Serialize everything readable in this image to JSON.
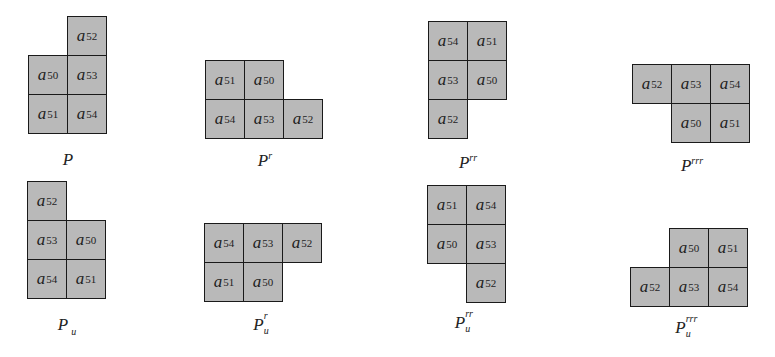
{
  "figure": {
    "cell_fill": "#b9b9b9",
    "cell_border": "#1a1a1a",
    "cell_size_px": 40,
    "panels": [
      {
        "id": "P",
        "caption": {
          "base": "P",
          "sup": "",
          "sub": ""
        },
        "cells": [
          {
            "var": "a",
            "idx": "52",
            "col": 1,
            "row": 0
          },
          {
            "var": "a",
            "idx": "50",
            "col": 0,
            "row": 1
          },
          {
            "var": "a",
            "idx": "53",
            "col": 1,
            "row": 1
          },
          {
            "var": "a",
            "idx": "51",
            "col": 0,
            "row": 2
          },
          {
            "var": "a",
            "idx": "54",
            "col": 1,
            "row": 2
          }
        ]
      },
      {
        "id": "Pr",
        "caption": {
          "base": "P",
          "sup": "r",
          "sub": ""
        },
        "cells": [
          {
            "var": "a",
            "idx": "51",
            "col": 0,
            "row": 0
          },
          {
            "var": "a",
            "idx": "50",
            "col": 1,
            "row": 0
          },
          {
            "var": "a",
            "idx": "54",
            "col": 0,
            "row": 1
          },
          {
            "var": "a",
            "idx": "53",
            "col": 1,
            "row": 1
          },
          {
            "var": "a",
            "idx": "52",
            "col": 2,
            "row": 1
          }
        ]
      },
      {
        "id": "Prr",
        "caption": {
          "base": "P",
          "sup": "rr",
          "sub": ""
        },
        "cells": [
          {
            "var": "a",
            "idx": "54",
            "col": 0,
            "row": 0
          },
          {
            "var": "a",
            "idx": "51",
            "col": 1,
            "row": 0
          },
          {
            "var": "a",
            "idx": "53",
            "col": 0,
            "row": 1
          },
          {
            "var": "a",
            "idx": "50",
            "col": 1,
            "row": 1
          },
          {
            "var": "a",
            "idx": "52",
            "col": 0,
            "row": 2
          }
        ]
      },
      {
        "id": "Prrr",
        "caption": {
          "base": "P",
          "sup": "rrr",
          "sub": ""
        },
        "cells": [
          {
            "var": "a",
            "idx": "52",
            "col": 0,
            "row": 0
          },
          {
            "var": "a",
            "idx": "53",
            "col": 1,
            "row": 0
          },
          {
            "var": "a",
            "idx": "54",
            "col": 2,
            "row": 0
          },
          {
            "var": "a",
            "idx": "50",
            "col": 1,
            "row": 1
          },
          {
            "var": "a",
            "idx": "51",
            "col": 2,
            "row": 1
          }
        ]
      },
      {
        "id": "Pu",
        "caption": {
          "base": "P",
          "sup": "",
          "sub": "u"
        },
        "cells": [
          {
            "var": "a",
            "idx": "52",
            "col": 0,
            "row": 0
          },
          {
            "var": "a",
            "idx": "53",
            "col": 0,
            "row": 1
          },
          {
            "var": "a",
            "idx": "50",
            "col": 1,
            "row": 1
          },
          {
            "var": "a",
            "idx": "54",
            "col": 0,
            "row": 2
          },
          {
            "var": "a",
            "idx": "51",
            "col": 1,
            "row": 2
          }
        ]
      },
      {
        "id": "Pur",
        "caption": {
          "base": "P",
          "sup": "r",
          "sub": "u"
        },
        "cells": [
          {
            "var": "a",
            "idx": "54",
            "col": 0,
            "row": 0
          },
          {
            "var": "a",
            "idx": "53",
            "col": 1,
            "row": 0
          },
          {
            "var": "a",
            "idx": "52",
            "col": 2,
            "row": 0
          },
          {
            "var": "a",
            "idx": "51",
            "col": 0,
            "row": 1
          },
          {
            "var": "a",
            "idx": "50",
            "col": 1,
            "row": 1
          }
        ]
      },
      {
        "id": "Purr",
        "caption": {
          "base": "P",
          "sup": "rr",
          "sub": "u"
        },
        "cells": [
          {
            "var": "a",
            "idx": "51",
            "col": 0,
            "row": 0
          },
          {
            "var": "a",
            "idx": "54",
            "col": 1,
            "row": 0
          },
          {
            "var": "a",
            "idx": "50",
            "col": 0,
            "row": 1
          },
          {
            "var": "a",
            "idx": "53",
            "col": 1,
            "row": 1
          },
          {
            "var": "a",
            "idx": "52",
            "col": 1,
            "row": 2
          }
        ]
      },
      {
        "id": "Purrr",
        "caption": {
          "base": "P",
          "sup": "rrr",
          "sub": "u"
        },
        "cells": [
          {
            "var": "a",
            "idx": "50",
            "col": 1,
            "row": 0
          },
          {
            "var": "a",
            "idx": "51",
            "col": 2,
            "row": 0
          },
          {
            "var": "a",
            "idx": "52",
            "col": 0,
            "row": 1
          },
          {
            "var": "a",
            "idx": "53",
            "col": 1,
            "row": 1
          },
          {
            "var": "a",
            "idx": "54",
            "col": 2,
            "row": 1
          }
        ]
      }
    ]
  }
}
